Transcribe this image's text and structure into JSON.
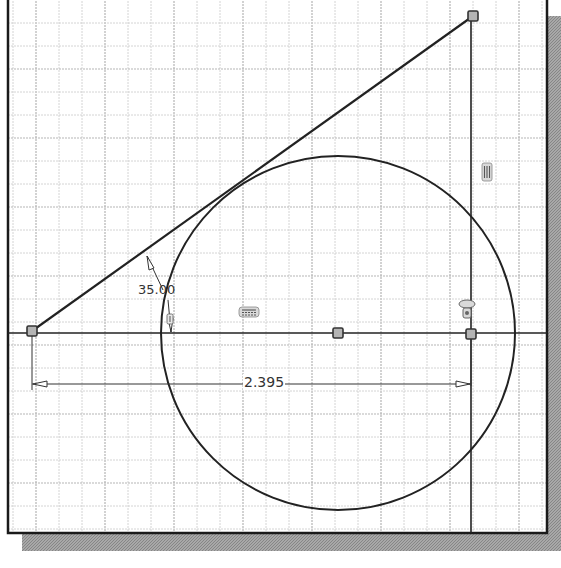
{
  "canvas": {
    "width": 561,
    "height": 568,
    "background": "#ffffff",
    "frame": {
      "left": 8,
      "top": -2,
      "right": 547,
      "bottom": 533,
      "stroke": "#1a1a1a"
    },
    "shadow": {
      "color": "#9a9a9a",
      "offset_x": 14,
      "offset_y": 18
    },
    "grid": {
      "spacing": 23,
      "origin_x": 36,
      "origin_y": 23,
      "minor_color": "#cfcfcf",
      "major_color": "#b5b5b5",
      "major_every": 3
    }
  },
  "sketch": {
    "line_color": "#222222",
    "construction_lines": [
      {
        "name": "horizontal-axis-line",
        "x1": 8,
        "y1": 333,
        "x2": 547,
        "y2": 333
      },
      {
        "name": "vertical-reference-line",
        "x1": 471,
        "y1": 17,
        "x2": 471,
        "y2": 533
      }
    ],
    "lines": [
      {
        "name": "angled-line",
        "x1": 32,
        "y1": 331,
        "x2": 473,
        "y2": 16
      }
    ],
    "circle": {
      "name": "tangent-circle",
      "cx": 338,
      "cy": 333,
      "r": 177
    },
    "points": [
      {
        "name": "left-endpoint",
        "x": 32,
        "y": 331
      },
      {
        "name": "top-right-endpoint",
        "x": 473,
        "y": 16
      },
      {
        "name": "circle-center-point",
        "x": 338,
        "y": 333
      },
      {
        "name": "right-intersection-point",
        "x": 471,
        "y": 334
      }
    ]
  },
  "dimensions": {
    "angle": {
      "value": "35.00",
      "label_x": 138,
      "label_y": 296
    },
    "linear": {
      "value": "2.395",
      "y": 384,
      "x_start": 32,
      "x_end": 471,
      "label_x": 243,
      "label_y": 390
    }
  },
  "constraints": [
    {
      "name": "vertical-constraint-icon",
      "glyph": "vertical",
      "x": 487,
      "y": 172
    },
    {
      "name": "horizontal-constraint-icon",
      "glyph": "horizontal",
      "x": 249,
      "y": 312
    },
    {
      "name": "coincident-constraint-icon",
      "glyph": "coincident",
      "x": 467,
      "y": 309
    },
    {
      "name": "tangent-constraint-icon",
      "glyph": "tangent",
      "x": 170,
      "y": 320
    }
  ]
}
